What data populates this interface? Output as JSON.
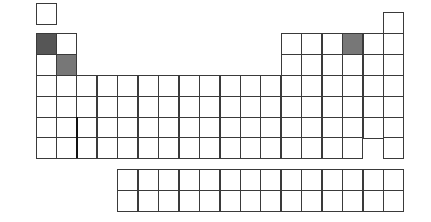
{
  "diagram": {
    "type": "periodic-table-outline",
    "colors": {
      "border": "#3a3a3a",
      "background": "#ffffff",
      "dark_shade": "#565656",
      "mid_shade": "#777777"
    },
    "layout": {
      "origin_x": 35.5,
      "pitch_x": 20.45,
      "cell_w": 21,
      "cell_h": 21.5,
      "row_y": {
        "1": 3,
        "2": 33,
        "3": 54,
        "4": 75,
        "5": 96,
        "6": 117,
        "7": 137
      },
      "he_y": 12,
      "f_block_y": [
        169,
        190
      ],
      "f_block_start_col": 5,
      "f_block_cols": 14
    },
    "main_rows": [
      {
        "period": 1,
        "cols": [
          1
        ]
      },
      {
        "period": 1,
        "cols": [
          18
        ],
        "offset": "he"
      },
      {
        "period": 2,
        "cols": [
          1,
          2,
          13,
          14,
          15,
          16,
          17,
          18
        ]
      },
      {
        "period": 3,
        "cols": [
          1,
          2,
          13,
          14,
          15,
          16,
          17,
          18
        ]
      },
      {
        "period": 4,
        "cols": [
          1,
          2,
          3,
          4,
          5,
          6,
          7,
          8,
          9,
          10,
          11,
          12,
          13,
          14,
          15,
          16,
          17,
          18
        ]
      },
      {
        "period": 5,
        "cols": [
          1,
          2,
          3,
          4,
          5,
          6,
          7,
          8,
          9,
          10,
          11,
          12,
          13,
          14,
          15,
          16,
          17,
          18
        ]
      },
      {
        "period": 6,
        "cols": [
          1,
          2,
          3,
          4,
          5,
          6,
          7,
          8,
          9,
          10,
          11,
          12,
          13,
          14,
          15,
          16,
          17,
          18
        ]
      },
      {
        "period": 7,
        "cols": [
          1,
          2,
          3,
          4,
          5,
          6,
          7,
          8,
          9,
          10,
          11,
          12,
          13,
          14,
          15,
          16,
          18
        ]
      }
    ],
    "highlighted_cells": [
      {
        "period": 2,
        "col": 1,
        "shade": "dark_shade"
      },
      {
        "period": 3,
        "col": 2,
        "shade": "mid_shade"
      },
      {
        "period": 2,
        "col": 16,
        "shade": "mid_shade"
      }
    ],
    "divider": {
      "x": 77,
      "y_top": 117,
      "y_bottom": 158,
      "width": 2
    }
  }
}
